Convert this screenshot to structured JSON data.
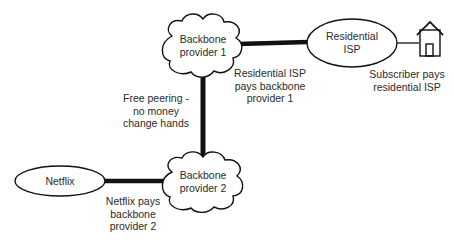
{
  "diagram": {
    "nodes": {
      "backbone1": {
        "line1": "Backbone",
        "line2": "provider 1",
        "shape": "cloud"
      },
      "backbone2": {
        "line1": "Backbone",
        "line2": "provider 2",
        "shape": "cloud"
      },
      "residential_isp": {
        "line1": "Residential",
        "line2": "ISP",
        "shape": "ellipse"
      },
      "netflix": {
        "line1": "Netflix",
        "shape": "ellipse"
      },
      "subscriber": {
        "icon": "house-icon"
      }
    },
    "edges": [
      {
        "from": "backbone1",
        "to": "residential_isp",
        "style": "thick"
      },
      {
        "from": "backbone1",
        "to": "backbone2",
        "style": "thick"
      },
      {
        "from": "netflix",
        "to": "backbone2",
        "style": "thick"
      },
      {
        "from": "residential_isp",
        "to": "subscriber",
        "style": "thin"
      }
    ],
    "annotations": {
      "isp_pays": {
        "line1": "Residential ISP",
        "line2": "pays backbone",
        "line3": "provider 1"
      },
      "subscriber_pays": {
        "line1": "Subscriber pays",
        "line2": "residential ISP"
      },
      "peering": {
        "line1": "Free peering -",
        "line2": "no money",
        "line3": "change hands"
      },
      "netflix_pays": {
        "line1": "Netflix pays",
        "line2": "backbone",
        "line3": "provider 2"
      }
    },
    "colors": {
      "stroke": "#111111",
      "text": "#2a2a2a",
      "background": "#ffffff"
    }
  }
}
